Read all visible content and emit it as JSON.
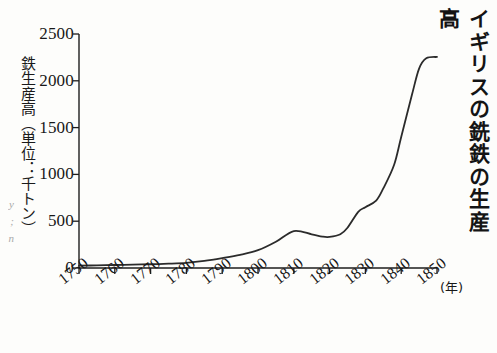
{
  "title": "イギリスの銑鉄の生産高",
  "edge_bleed_text": "y\n;\nn",
  "axis": {
    "y_label": "鉄生産高（単位：千トン）",
    "x_unit": "(年)",
    "y_ticks": [
      "0",
      "500",
      "1000",
      "1500",
      "2000",
      "2500"
    ],
    "x_ticks": [
      "1750",
      "1760",
      "1770",
      "1780",
      "1790",
      "1800",
      "1810",
      "1820",
      "1830",
      "1840",
      "1850"
    ]
  },
  "style": {
    "line_color": "#2b2b2b",
    "axis_color": "#1d1d1d",
    "background": "#fdfdfb"
  },
  "chart_data": {
    "type": "line",
    "title": "イギリスの銑鉄の生産高",
    "xlabel": "(年)",
    "ylabel": "鉄生産高（単位：千トン）",
    "xlim": [
      1750,
      1850
    ],
    "ylim": [
      0,
      2500
    ],
    "grid": false,
    "legend": "none",
    "x": [
      1750,
      1755,
      1760,
      1765,
      1770,
      1775,
      1780,
      1785,
      1790,
      1795,
      1800,
      1805,
      1810,
      1815,
      1818,
      1820,
      1823,
      1825,
      1828,
      1830,
      1833,
      1835,
      1838,
      1840,
      1843,
      1845,
      1847,
      1850
    ],
    "values": [
      25,
      28,
      32,
      36,
      40,
      46,
      55,
      75,
      105,
      140,
      190,
      280,
      395,
      360,
      335,
      332,
      360,
      430,
      600,
      650,
      720,
      850,
      1100,
      1400,
      1850,
      2130,
      2240,
      2255
    ],
    "annotations": [
      {
        "x": 1810,
        "y": 395,
        "note": "local peak"
      },
      {
        "x": 1820,
        "y": 332,
        "note": "post-war dip"
      },
      {
        "x": 1830,
        "y": 650,
        "note": "shoulder"
      },
      {
        "x": 1850,
        "y": 2255,
        "note": "plateau"
      }
    ]
  }
}
